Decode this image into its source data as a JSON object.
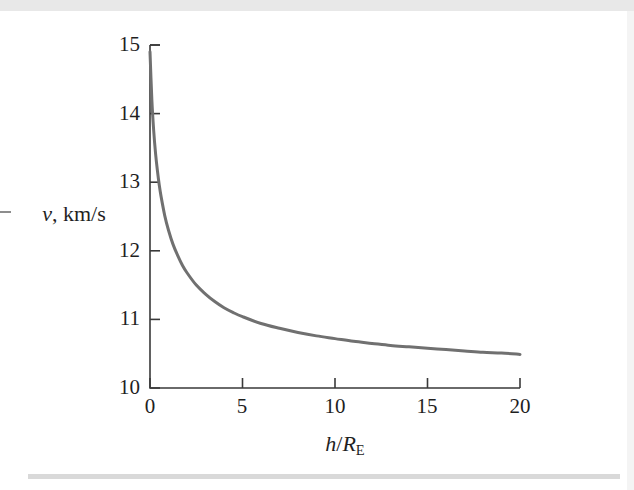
{
  "figure": {
    "kind": "scanned-textbook-plot",
    "curve_color": "#707070",
    "axis_color": "#3a3a3a",
    "background": "#ffffff"
  },
  "axis_labels": {
    "y_var": "v",
    "y_sep": ", ",
    "y_units": "km/s",
    "x_numerator": "h",
    "x_slash": "/",
    "x_denominator": "R",
    "x_subscript": "E"
  },
  "chart_data": {
    "type": "line",
    "title": "",
    "xlabel": "h/R_E",
    "ylabel": "v, km/s",
    "xlim": [
      0,
      20
    ],
    "ylim": [
      10,
      15
    ],
    "xticks": [
      0,
      5,
      10,
      15,
      20
    ],
    "xtick_labels": [
      "0",
      "5",
      "10",
      "15",
      "20"
    ],
    "yticks": [
      10,
      11,
      12,
      13,
      14,
      15
    ],
    "ytick_labels": [
      "10",
      "11",
      "12",
      "13",
      "14",
      "15"
    ],
    "grid": false,
    "legend": null,
    "series": [
      {
        "name": "v",
        "color": "#707070",
        "linewidth": 3,
        "x": [
          0,
          0.1,
          0.2,
          0.3,
          0.4,
          0.5,
          0.6,
          0.8,
          1,
          1.25,
          1.5,
          1.75,
          2,
          2.5,
          3,
          3.5,
          4,
          4.5,
          5,
          6,
          7,
          8,
          9,
          10,
          11,
          12,
          13,
          14,
          15,
          16,
          17,
          18,
          19,
          20
        ],
        "y": [
          14.9,
          14.2,
          13.75,
          13.42,
          13.17,
          12.96,
          12.79,
          12.51,
          12.3,
          12.09,
          11.93,
          11.79,
          11.68,
          11.5,
          11.37,
          11.26,
          11.17,
          11.1,
          11.04,
          10.94,
          10.87,
          10.81,
          10.76,
          10.72,
          10.68,
          10.65,
          10.62,
          10.6,
          10.58,
          10.56,
          10.54,
          10.52,
          10.51,
          10.49
        ]
      }
    ],
    "annotations": []
  },
  "geometry": {
    "plot_left": 150,
    "plot_right": 520,
    "plot_top": 45,
    "plot_bottom": 388
  }
}
